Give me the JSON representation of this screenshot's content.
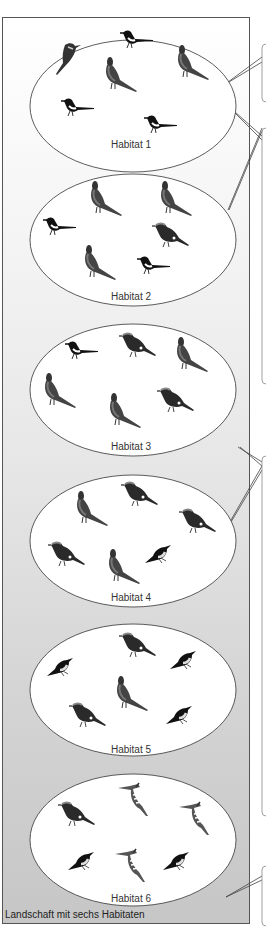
{
  "diagram": {
    "caption": "Landschaft mit sechs Habitaten",
    "colors": {
      "frame_border": "#555555",
      "ellipse_fill": "#ffffff",
      "ellipse_stroke": "#333333",
      "background_top": "#ffffff",
      "background_bottom": "#c6c6c6"
    },
    "habitats": [
      {
        "label": "Habitat 1",
        "birds": [
          "bee-eater",
          "magpie",
          "pheasant",
          "pheasant",
          "magpie",
          "magpie"
        ]
      },
      {
        "label": "Habitat 2",
        "birds": [
          "pheasant",
          "pheasant",
          "magpie",
          "jay",
          "pheasant",
          "magpie"
        ]
      },
      {
        "label": "Habitat 3",
        "birds": [
          "magpie",
          "jay",
          "pheasant",
          "pheasant",
          "pheasant",
          "jay"
        ]
      },
      {
        "label": "Habitat 4",
        "birds": [
          "jay",
          "pheasant",
          "jay",
          "jay",
          "pheasant",
          "mynah"
        ]
      },
      {
        "label": "Habitat 5",
        "birds": [
          "jay",
          "mynah",
          "mynah",
          "pheasant",
          "jay",
          "mynah"
        ]
      },
      {
        "label": "Habitat 6",
        "birds": [
          "jay",
          "hoopoe",
          "hoopoe",
          "mynah",
          "hoopoe",
          "mynah"
        ]
      }
    ]
  }
}
